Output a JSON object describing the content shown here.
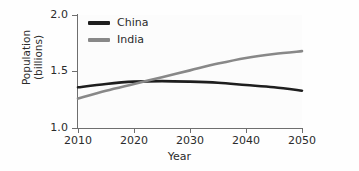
{
  "chart_data": {
    "type": "line",
    "title": "",
    "subtitle": "",
    "xlabel": "Year",
    "ylabel": "Population\n(billions)",
    "ylabel_lines": [
      "Population",
      "(billions)"
    ],
    "xlim": [
      2010,
      2050
    ],
    "ylim": [
      1.0,
      2.0
    ],
    "xticks": [
      2010,
      2020,
      2030,
      2040,
      2050
    ],
    "xticklabels": [
      "2010",
      "2020",
      "2030",
      "2040",
      "2050"
    ],
    "yticks": [
      1.0,
      1.5,
      2.0
    ],
    "yticklabels": [
      "1.0",
      "1.5",
      "2.0"
    ],
    "grid": false,
    "legend_position": "upper left (inside axes)",
    "x": [
      2010,
      2015,
      2020,
      2025,
      2030,
      2035,
      2040,
      2045,
      2050
    ],
    "series": [
      {
        "name": "China",
        "color": "#1e1e1e",
        "linewidth": 2.6,
        "values": [
          1.36,
          1.39,
          1.41,
          1.415,
          1.41,
          1.4,
          1.38,
          1.36,
          1.33
        ]
      },
      {
        "name": "India",
        "color": "#888888",
        "linewidth": 2.6,
        "values": [
          1.26,
          1.33,
          1.39,
          1.45,
          1.51,
          1.57,
          1.62,
          1.655,
          1.68
        ]
      }
    ],
    "annotations": [
      "China and India population curves cross at approximately 2022 near 1.41 billion"
    ]
  },
  "axes": {
    "x_title": "Year",
    "y_title_line1": "Population",
    "y_title_line2": "(billions)",
    "x_tick_labels": [
      "2010",
      "2020",
      "2030",
      "2040",
      "2050"
    ],
    "y_tick_labels": [
      "1.0",
      "1.5",
      "2.0"
    ]
  },
  "legend": {
    "items": [
      {
        "label": "China",
        "color": "#1e1e1e"
      },
      {
        "label": "India",
        "color": "#888888"
      }
    ]
  },
  "colors": {
    "china": "#1e1e1e",
    "india": "#888888",
    "axis": "#6e6e6e",
    "text": "#2b2b2b",
    "background": "#fefefe"
  }
}
